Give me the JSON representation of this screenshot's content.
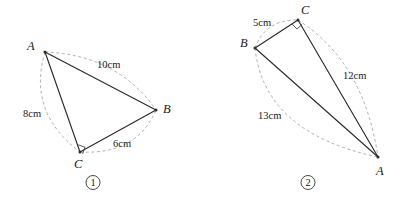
{
  "page": {
    "background_color": "#ffffff",
    "line_color": "#2b2b2b",
    "arc_color": "#9a9a9a",
    "width": 405,
    "height": 207
  },
  "figures": [
    {
      "id": "figure-1",
      "number_label": "1",
      "number_position": {
        "x": 93,
        "y": 186
      },
      "right_angle_at": "C",
      "vertices": [
        {
          "name": "A",
          "x": 45,
          "y": 52,
          "label_x": 27,
          "label_y": 50
        },
        {
          "name": "B",
          "x": 156,
          "y": 110,
          "label_x": 163,
          "label_y": 113
        },
        {
          "name": "C",
          "x": 80,
          "y": 152,
          "label_x": 74,
          "label_y": 168
        }
      ],
      "sides": [
        {
          "from": "A",
          "to": "B",
          "length": "10cm",
          "label_x": 97,
          "label_y": 68
        },
        {
          "from": "A",
          "to": "C",
          "length": "8cm",
          "label_x": 23,
          "label_y": 117
        },
        {
          "from": "C",
          "to": "B",
          "length": "6cm",
          "label_x": 113,
          "label_y": 147
        }
      ]
    },
    {
      "id": "figure-2",
      "number_label": "2",
      "number_position": {
        "x": 308,
        "y": 186
      },
      "right_angle_at": "C",
      "vertices": [
        {
          "name": "B",
          "x": 255,
          "y": 48,
          "label_x": 240,
          "label_y": 47
        },
        {
          "name": "C",
          "x": 298,
          "y": 20,
          "label_x": 301,
          "label_y": 14
        },
        {
          "name": "A",
          "x": 378,
          "y": 157,
          "label_x": 376,
          "label_y": 175
        }
      ],
      "sides": [
        {
          "from": "B",
          "to": "C",
          "length": "5cm",
          "label_x": 253,
          "label_y": 26
        },
        {
          "from": "C",
          "to": "A",
          "length": "12cm",
          "label_x": 343,
          "label_y": 79
        },
        {
          "from": "B",
          "to": "A",
          "length": "13cm",
          "label_x": 258,
          "label_y": 119
        }
      ]
    }
  ]
}
